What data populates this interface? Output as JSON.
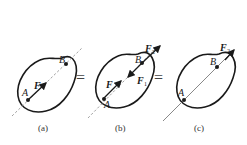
{
  "figure": {
    "panels": [
      {
        "id": "a",
        "caption": "(a)",
        "point_A": "A",
        "point_B": "B",
        "line_style": "dashed",
        "forces": [
          {
            "label": "F",
            "sub": "",
            "at": "A"
          }
        ]
      },
      {
        "id": "b",
        "caption": "(b)",
        "point_A": "A",
        "point_B": "B",
        "line_style": "dashed",
        "forces": [
          {
            "label": "F",
            "sub": "",
            "at": "A"
          },
          {
            "label": "F",
            "sub": "1",
            "at": "B"
          },
          {
            "label": "F",
            "sub": "2",
            "at": "B"
          }
        ]
      },
      {
        "id": "c",
        "caption": "(c)",
        "point_A": "A",
        "point_B": "B",
        "line_style": "solid",
        "forces": [
          {
            "label": "F",
            "sub": "2",
            "at": "B"
          }
        ]
      }
    ],
    "equals": [
      "=",
      "="
    ],
    "colors": {
      "outline": "#1a1a1a",
      "dashed_line": "#8a8a8a",
      "solid_line": "#7a7a7a",
      "force_arrow": "#1a1a1a"
    }
  }
}
